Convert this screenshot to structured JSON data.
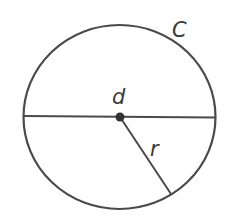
{
  "diagram": {
    "labels": {
      "circumference": "C",
      "diameter": "d",
      "radius": "r"
    },
    "colors": {
      "stroke": "#4a4a4a",
      "center_dot": "#333333",
      "text": "#3a3a3a",
      "background": "#ffffff"
    }
  }
}
